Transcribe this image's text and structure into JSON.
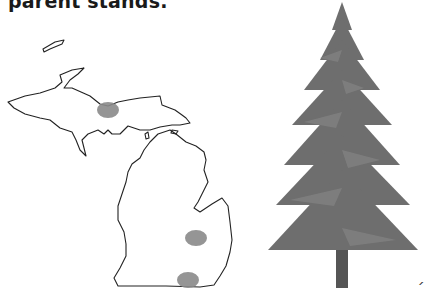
{
  "caption": "parent stands.",
  "map": {
    "label": "Michigan",
    "stroke_color": "#222222",
    "marker_color": "#8a8a8a",
    "markers": [
      {
        "name": "upper-peninsula",
        "cx": 108,
        "cy": 80,
        "rx": 11,
        "ry": 8
      },
      {
        "name": "thumb-region",
        "cx": 196,
        "cy": 208,
        "rx": 11,
        "ry": 8
      },
      {
        "name": "southeast",
        "cx": 188,
        "cy": 250,
        "rx": 11,
        "ry": 8
      }
    ]
  },
  "tree": {
    "label": "conifer-tree-illustration",
    "foliage_color": "#6e6e6e",
    "trunk_color": "#555555"
  },
  "corner_mark": "´"
}
